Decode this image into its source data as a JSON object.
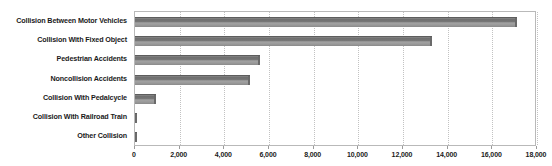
{
  "chart_data": {
    "type": "bar",
    "orientation": "horizontal",
    "title": "",
    "subtitle": "",
    "xlabel": "",
    "ylabel": "",
    "grid": true,
    "legend": false,
    "legend_position": "none",
    "xlim": [
      0,
      18000
    ],
    "xticks": [
      0,
      2000,
      4000,
      6000,
      8000,
      10000,
      12000,
      14000,
      16000,
      18000
    ],
    "xtick_labels": [
      "0",
      "2,000",
      "4,000",
      "6,000",
      "8,000",
      "10,000",
      "12,000",
      "14,000",
      "16,000",
      "18,000"
    ],
    "categories": [
      "Collision Between Motor Vehicles",
      "Collision With Fixed Object",
      "Pedestrian Accidents",
      "Noncollision Accidents",
      "Collision With Pedalcycle",
      "Collision With Railroad Train",
      "Other Collision"
    ],
    "values": [
      17100,
      13320,
      5600,
      5150,
      950,
      90,
      60
    ],
    "series": [
      {
        "name": "Accidents",
        "values": [
          17100,
          13320,
          5600,
          5150,
          950,
          90,
          60
        ]
      }
    ],
    "colors": {
      "bar_top": "#6f6f6f",
      "bar_mid": "#a2a2a2",
      "bar_bottom": "#8a8a8a",
      "bar_edge": "#5d5d5d",
      "gridline": "#c2c2c2",
      "frame": "#b9b9b9",
      "text": "#1a1a1a",
      "background": "#ffffff"
    }
  }
}
